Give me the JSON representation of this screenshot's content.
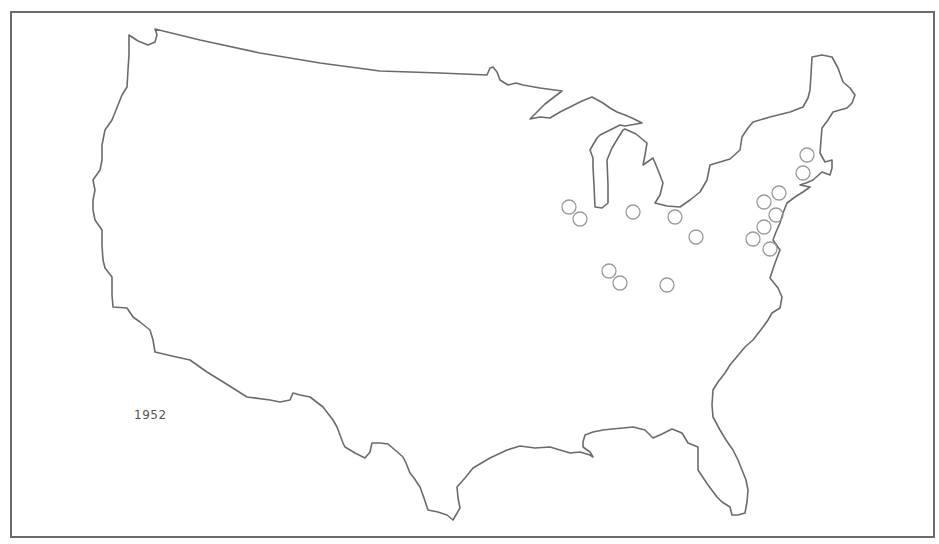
{
  "map": {
    "title_year": "1952",
    "region": "contiguous-united-states",
    "outline_color": "#6b6b6b",
    "marker_color": "#9a9a9a",
    "marker_style": "hollow-circle",
    "marker_radius": 7,
    "markers": [
      {
        "x": 569,
        "y": 207
      },
      {
        "x": 580,
        "y": 219
      },
      {
        "x": 633,
        "y": 212
      },
      {
        "x": 675,
        "y": 217
      },
      {
        "x": 696,
        "y": 237
      },
      {
        "x": 609,
        "y": 271
      },
      {
        "x": 620,
        "y": 283
      },
      {
        "x": 667,
        "y": 285
      },
      {
        "x": 807,
        "y": 155
      },
      {
        "x": 803,
        "y": 173
      },
      {
        "x": 779,
        "y": 193
      },
      {
        "x": 764,
        "y": 202
      },
      {
        "x": 776,
        "y": 215
      },
      {
        "x": 764,
        "y": 227
      },
      {
        "x": 753,
        "y": 239
      },
      {
        "x": 770,
        "y": 249
      }
    ]
  }
}
